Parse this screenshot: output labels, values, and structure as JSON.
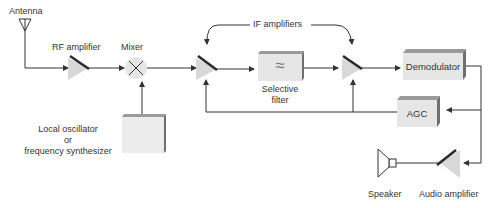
{
  "diagram": {
    "type": "superheterodyne receiver block diagram",
    "labels": {
      "antenna": "Antenna",
      "rf_amplifier": "RF amplifier",
      "mixer": "Mixer",
      "if_amplifiers": "IF amplifiers",
      "selective_filter_line1": "Selective",
      "selective_filter_line2": "filter",
      "demodulator": "Demodulator",
      "agc": "AGC",
      "local_osc_line1": "Local oscillator",
      "local_osc_line2": "or",
      "local_osc_line3": "frequency synthesizer",
      "speaker": "Speaker",
      "audio_amplifier": "Audio amplifier",
      "filter_symbol": "≈"
    },
    "colors": {
      "line": "#333333",
      "block_face": "#e6e6e6",
      "block_top": "#9a9a9a",
      "block_side": "#6f6f6f",
      "amp_fill": "#d8d8d8",
      "amp_bar": "#2a2a2a"
    }
  }
}
